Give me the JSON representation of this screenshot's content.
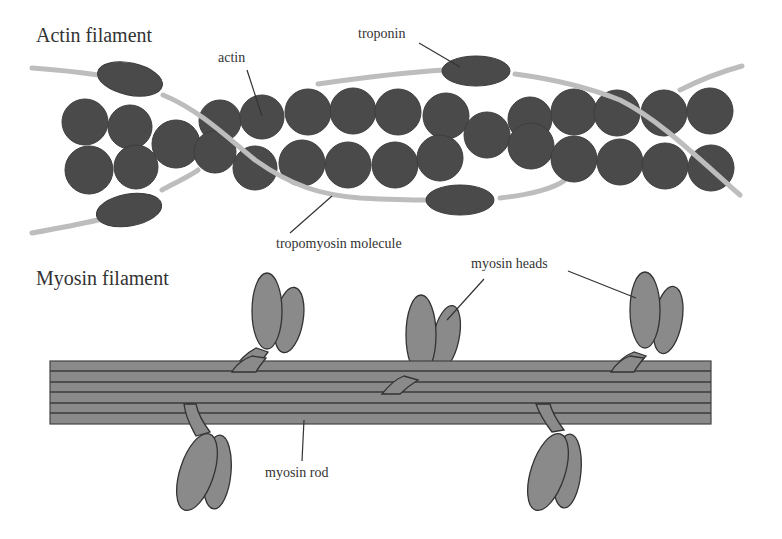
{
  "diagram": {
    "titles": {
      "actin_filament": "Actin filament",
      "myosin_filament": "Myosin filament"
    },
    "labels": {
      "actin": "actin",
      "troponin": "troponin",
      "tropomyosin": "tropomyosin molecule",
      "myosin_heads": "myosin heads",
      "myosin_rod": "myosin rod"
    },
    "colors": {
      "actin": "#4a4a4a",
      "troponin": "#4a4a4a",
      "tropomyosin": "#bdbdbd",
      "myosin": "#8a8a8a",
      "outline": "#333333",
      "text": "#333333",
      "background": "#ffffff"
    }
  }
}
